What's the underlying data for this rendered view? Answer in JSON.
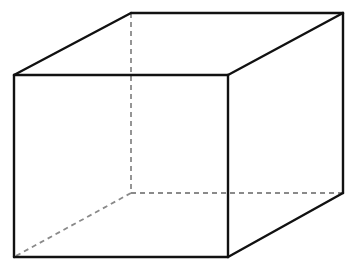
{
  "diagram": {
    "type": "wireframe-cube",
    "colors": {
      "background": "#ffffff",
      "visible_edge": "#111111",
      "hidden_edge": "#8a8a8a"
    },
    "vertices": {
      "front_top_left": [
        14,
        75
      ],
      "front_top_right": [
        228,
        75
      ],
      "front_bottom_left": [
        14,
        257
      ],
      "front_bottom_right": [
        228,
        257
      ],
      "back_top_left": [
        131,
        13
      ],
      "back_top_right": [
        343,
        13
      ],
      "back_bottom_left": [
        131,
        193
      ],
      "back_bottom_right": [
        343,
        193
      ]
    },
    "visible_edges": [
      [
        "front_top_left",
        "front_top_right"
      ],
      [
        "front_top_right",
        "front_bottom_right"
      ],
      [
        "front_bottom_right",
        "front_bottom_left"
      ],
      [
        "front_bottom_left",
        "front_top_left"
      ],
      [
        "front_top_left",
        "back_top_left"
      ],
      [
        "back_top_left",
        "back_top_right"
      ],
      [
        "back_top_right",
        "front_top_right"
      ],
      [
        "back_top_right",
        "back_bottom_right"
      ],
      [
        "back_bottom_right",
        "front_bottom_right"
      ]
    ],
    "hidden_edges": [
      [
        "back_top_left",
        "back_bottom_left"
      ],
      [
        "back_bottom_left",
        "back_bottom_right"
      ],
      [
        "back_bottom_left",
        "front_bottom_left"
      ]
    ]
  }
}
